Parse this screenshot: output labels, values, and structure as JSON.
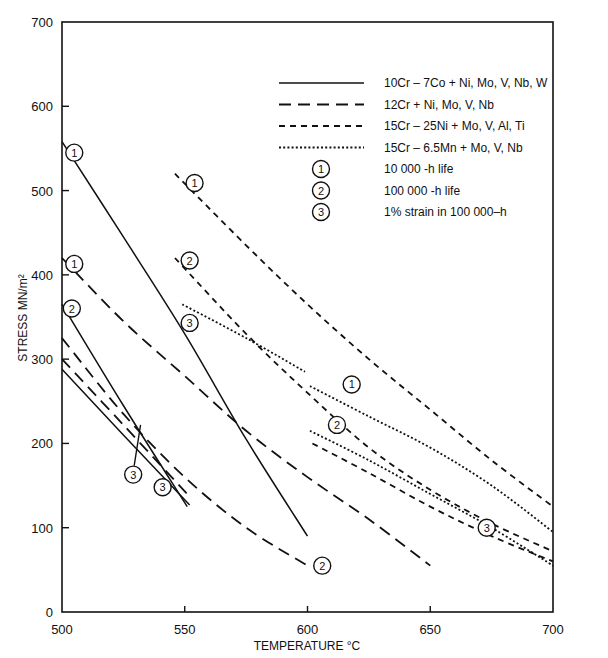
{
  "chart_data": {
    "type": "line",
    "title": "",
    "xlabel": "TEMPERATURE °C",
    "ylabel": "STRESS MN/m²",
    "xlim": [
      500,
      700
    ],
    "ylim": [
      0,
      700
    ],
    "xticks": [
      500,
      550,
      600,
      650,
      700
    ],
    "yticks": [
      0,
      100,
      200,
      300,
      400,
      500,
      600,
      700
    ],
    "grid": false,
    "legend_position": "upper right (inside plot)",
    "legend": {
      "line_styles": [
        {
          "style": "solid",
          "label": "10Cr – 7Co + Ni, Mo, V, Nb, W"
        },
        {
          "style": "long-dash",
          "label": "12Cr + Ni, Mo, V, Nb"
        },
        {
          "style": "short-dash",
          "label": "15Cr – 25Ni + Mo, V, Al, Ti"
        },
        {
          "style": "dotted",
          "label": "15Cr – 6.5Mn +  Mo, V, Nb"
        }
      ],
      "markers": [
        {
          "symbol": "1",
          "label": "10 000 -h life"
        },
        {
          "symbol": "2",
          "label": "100 000 -h life"
        },
        {
          "symbol": "3",
          "label": "1% strain in 100 000–h"
        }
      ]
    },
    "series": [
      {
        "name": "10Cr-7Co 10 000-h life",
        "style": "solid",
        "criterion": "1",
        "x": [
          500,
          525,
          550,
          575,
          600
        ],
        "y": [
          558,
          445,
          330,
          205,
          90
        ]
      },
      {
        "name": "10Cr-7Co 100 000-h life",
        "style": "solid",
        "criterion": "2",
        "x": [
          500,
          525,
          551
        ],
        "y": [
          365,
          245,
          125
        ]
      },
      {
        "name": "10Cr-7Co 1% strain",
        "style": "solid",
        "criterion": "3",
        "x": [
          500,
          525,
          552
        ],
        "y": [
          288,
          210,
          127
        ]
      },
      {
        "name": "12Cr 10 000-h life",
        "style": "long-dash",
        "criterion": "1",
        "x": [
          500,
          525,
          550,
          575,
          600,
          625,
          650
        ],
        "y": [
          420,
          345,
          280,
          215,
          160,
          110,
          55
        ]
      },
      {
        "name": "12Cr 100 000-h life",
        "style": "long-dash",
        "criterion": "2",
        "x": [
          500,
          525,
          550,
          575,
          600
        ],
        "y": [
          325,
          235,
          160,
          100,
          55
        ]
      },
      {
        "name": "12Cr 1% strain",
        "style": "long-dash",
        "criterion": "3",
        "x": [
          500,
          525,
          551
        ],
        "y": [
          300,
          222,
          140
        ]
      },
      {
        "name": "15Cr-25Ni 10 000-h life",
        "style": "short-dash",
        "criterion": "1",
        "x": [
          546,
          575,
          600,
          625,
          650,
          675,
          700
        ],
        "y": [
          520,
          435,
          365,
          300,
          240,
          180,
          125
        ]
      },
      {
        "name": "15Cr-25Ni 100 000-h life",
        "style": "short-dash",
        "criterion": "2",
        "x": [
          546,
          575,
          600,
          625,
          650,
          675,
          700
        ],
        "y": [
          420,
          330,
          260,
          195,
          145,
          105,
          72
        ]
      },
      {
        "name": "15Cr-25Ni 1% strain",
        "style": "short-dash",
        "criterion": "3",
        "x": [
          602,
          625,
          650,
          675,
          700
        ],
        "y": [
          200,
          165,
          125,
          90,
          60
        ]
      },
      {
        "name": "15Cr-6.5Mn 10 000-h life",
        "style": "dotted",
        "criterion": "1",
        "x": [
          601,
          625,
          650,
          675,
          700
        ],
        "y": [
          268,
          232,
          195,
          150,
          95
        ]
      },
      {
        "name": "15Cr-6.5Mn 100 000-h life",
        "style": "dotted",
        "criterion": "2",
        "x": [
          601,
          625,
          650,
          675,
          700
        ],
        "y": [
          215,
          180,
          140,
          100,
          55
        ]
      },
      {
        "name": "15Cr-6.5Mn 1% strain",
        "style": "dotted",
        "criterion": "3",
        "x": [
          549,
          575,
          599
        ],
        "y": [
          365,
          325,
          285
        ]
      }
    ],
    "annotations": [
      {
        "symbol": "1",
        "x": 505,
        "y": 545
      },
      {
        "symbol": "1",
        "x": 505,
        "y": 413
      },
      {
        "symbol": "2",
        "x": 504,
        "y": 360
      },
      {
        "symbol": "3",
        "x": 529,
        "y": 163
      },
      {
        "symbol": "3",
        "x": 541,
        "y": 148
      },
      {
        "symbol": "1",
        "x": 554,
        "y": 509
      },
      {
        "symbol": "2",
        "x": 552,
        "y": 417
      },
      {
        "symbol": "3",
        "x": 552,
        "y": 343
      },
      {
        "symbol": "1",
        "x": 618,
        "y": 270
      },
      {
        "symbol": "2",
        "x": 612,
        "y": 222
      },
      {
        "symbol": "2",
        "x": 606,
        "y": 55
      },
      {
        "symbol": "3",
        "x": 673,
        "y": 100
      }
    ]
  }
}
